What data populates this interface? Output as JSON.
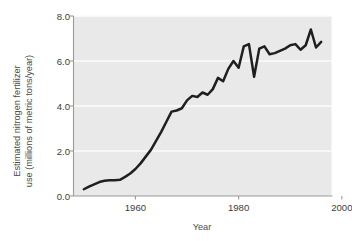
{
  "chart_data": {
    "type": "line",
    "title": "",
    "xlabel": "Year",
    "ylabel": "Estimated nitrogen fertilizer use (millions of metric tons/year)",
    "ylabel_line1": "Estimated nitrogen fertilizer",
    "ylabel_line2": "use (millions of metric tons/year)",
    "xlim": [
      1948,
      1998
    ],
    "ylim": [
      0.0,
      8.0
    ],
    "xticks": [
      1960,
      1980,
      2000
    ],
    "xticklabels": [
      "1960",
      "1980",
      "2000"
    ],
    "yticks": [
      0.0,
      2.0,
      4.0,
      6.0,
      8.0
    ],
    "yticklabels": [
      "0.0",
      "2.0",
      "4.0",
      "6.0",
      "8.0"
    ],
    "grid": "horizontal-white-faint",
    "legend": "none",
    "series": [
      {
        "name": "Estimated nitrogen fertilizer use",
        "color": "#1f1f1f",
        "x": [
          1950,
          1951,
          1952,
          1953,
          1954,
          1955,
          1956,
          1957,
          1958,
          1959,
          1960,
          1961,
          1962,
          1963,
          1964,
          1965,
          1966,
          1967,
          1968,
          1969,
          1970,
          1971,
          1972,
          1973,
          1974,
          1975,
          1976,
          1977,
          1978,
          1979,
          1980,
          1981,
          1982,
          1983,
          1984,
          1985,
          1986,
          1987,
          1988,
          1989,
          1990,
          1991,
          1992,
          1993,
          1994,
          1995,
          1996
        ],
        "y": [
          0.3,
          0.42,
          0.52,
          0.62,
          0.68,
          0.7,
          0.7,
          0.72,
          0.85,
          1.0,
          1.2,
          1.45,
          1.75,
          2.05,
          2.45,
          2.85,
          3.3,
          3.75,
          3.8,
          3.9,
          4.25,
          4.45,
          4.4,
          4.6,
          4.5,
          4.75,
          5.25,
          5.1,
          5.65,
          6.0,
          5.7,
          6.65,
          6.75,
          5.3,
          6.55,
          6.65,
          6.3,
          6.35,
          6.45,
          6.55,
          6.7,
          6.75,
          6.5,
          6.7,
          7.4,
          6.6,
          6.85
        ]
      }
    ]
  },
  "axes": {
    "panel_color": "#e9e9e9",
    "gridline_color": "#fbfbfb",
    "axis_color": "#9a9a9a",
    "tick_text_color": "#3d3d3d",
    "label_text_color": "#4a4a4a"
  }
}
